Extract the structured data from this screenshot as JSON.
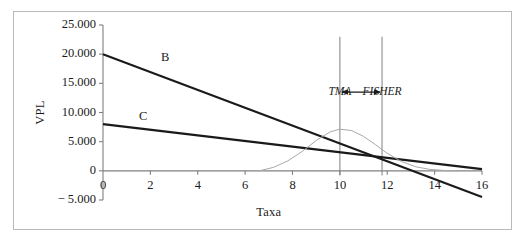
{
  "figure": {
    "background": "#ffffff",
    "border_color": "#b9b9b9"
  },
  "chart_data": {
    "type": "line",
    "title": "",
    "xlabel": "Taxa",
    "ylabel": "VPL",
    "xlim": [
      0,
      16
    ],
    "ylim": [
      -5000,
      25000
    ],
    "grid": false,
    "legend": "inline-labels",
    "x_ticks": [
      "0",
      "2",
      "4",
      "6",
      "8",
      "10",
      "12",
      "14",
      "16"
    ],
    "x_tick_values": [
      0,
      2,
      4,
      6,
      8,
      10,
      12,
      14,
      16
    ],
    "y_ticks": [
      "25.000",
      "20.000",
      "15.000",
      "10.000",
      "5.000",
      "0",
      "− 5.000"
    ],
    "y_tick_values": [
      25000,
      20000,
      15000,
      10000,
      5000,
      0,
      -5000
    ],
    "series": [
      {
        "name": "B",
        "label": "B",
        "color": "#1a1a1a",
        "width": 2.1,
        "points": [
          [
            0,
            20000
          ],
          [
            16,
            -4500
          ]
        ]
      },
      {
        "name": "C",
        "label": "C",
        "color": "#1a1a1a",
        "width": 2.1,
        "points": [
          [
            0,
            8000
          ],
          [
            16,
            300
          ]
        ]
      },
      {
        "name": "bell-curve",
        "label": "",
        "color": "#a8a8a8",
        "width": 1.0,
        "points": [
          [
            6.6,
            0
          ],
          [
            7.2,
            600
          ],
          [
            7.8,
            1700
          ],
          [
            8.4,
            3300
          ],
          [
            9.0,
            5200
          ],
          [
            9.6,
            6700
          ],
          [
            10.0,
            7150
          ],
          [
            10.5,
            6900
          ],
          [
            11.0,
            5900
          ],
          [
            11.5,
            4500
          ],
          [
            12.0,
            3000
          ],
          [
            12.6,
            1600
          ],
          [
            13.2,
            700
          ],
          [
            13.8,
            250
          ],
          [
            14.4,
            60
          ],
          [
            15.0,
            0
          ]
        ]
      }
    ],
    "markers": [
      {
        "name": "TMA",
        "label": "TMA",
        "x": 10.0,
        "color": "#8c8c8c",
        "y_top": 23000,
        "y_bottom": -800
      },
      {
        "name": "FISHER",
        "label": "FISHER",
        "x": 11.78,
        "color": "#8c8c8c",
        "y_top": 23000,
        "y_bottom": -800
      }
    ],
    "annotations": [
      {
        "name": "tma-fisher-span-arrow",
        "type": "double-arrow",
        "x_from": 10.0,
        "x_to": 11.78,
        "y": 13500,
        "color": "#1a1a1a"
      }
    ]
  }
}
